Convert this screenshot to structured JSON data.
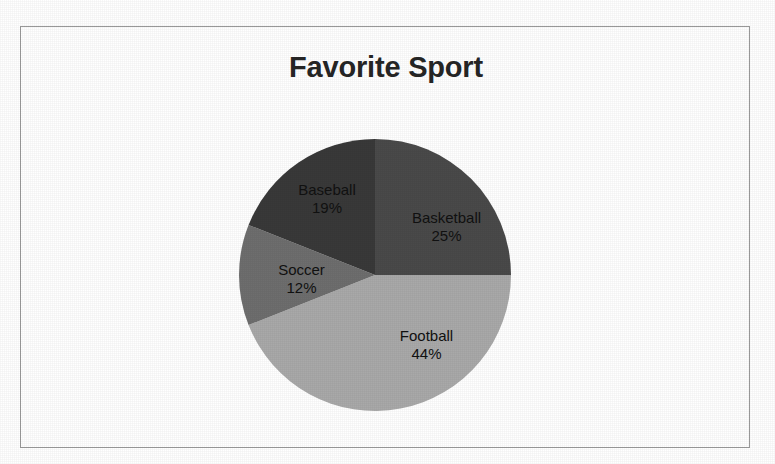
{
  "chart": {
    "title": "Favorite Sport",
    "frame_border_color": "#9a9a9a",
    "background_color": "#ffffff",
    "title_color": "#262626"
  },
  "chart_data": {
    "type": "pie",
    "title": "Favorite Sport",
    "xlabel": "",
    "ylabel": "",
    "grid": false,
    "legend": "none",
    "labels_inside_slices": true,
    "start_angle_deg": 0,
    "direction": "clockwise",
    "categories": [
      "Basketball",
      "Football",
      "Soccer",
      "Baseball"
    ],
    "values": [
      25,
      44,
      12,
      19
    ],
    "value_unit": "%",
    "colors": [
      "#4a4a4a",
      "#a9a9a9",
      "#6e6e6e",
      "#393939"
    ],
    "slices": [
      {
        "label": "Basketball",
        "value": 25,
        "value_text": "25%",
        "color": "#4a4a4a",
        "start_deg": 0,
        "end_deg": 90
      },
      {
        "label": "Football",
        "value": 44,
        "value_text": "44%",
        "color": "#a9a9a9",
        "start_deg": 90,
        "end_deg": 248.4
      },
      {
        "label": "Soccer",
        "value": 12,
        "value_text": "12%",
        "color": "#6e6e6e",
        "start_deg": 248.4,
        "end_deg": 291.6
      },
      {
        "label": "Baseball",
        "value": 19,
        "value_text": "19%",
        "color": "#393939",
        "start_deg": 291.6,
        "end_deg": 360
      }
    ]
  }
}
